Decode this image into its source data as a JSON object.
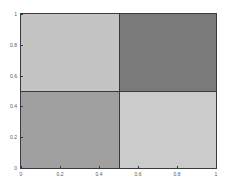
{
  "chart_data": {
    "type": "heatmap",
    "title": "",
    "xlabel": "",
    "ylabel": "",
    "xlim": [
      0,
      1
    ],
    "ylim": [
      0,
      1
    ],
    "grid": false,
    "legend": null,
    "x_ticks": [
      "0",
      "0.2",
      "0.4",
      "0.6",
      "0.8",
      "1"
    ],
    "y_ticks": [
      "0",
      "0.2",
      "0.4",
      "0.6",
      "0.8",
      "1"
    ],
    "x_edges": [
      0,
      0.5,
      1
    ],
    "y_edges": [
      0,
      0.5,
      1
    ],
    "cells": [
      {
        "x0": 0,
        "x1": 0.5,
        "y0": 0.5,
        "y1": 1,
        "color": "#c4c4c4",
        "shade": "light"
      },
      {
        "x0": 0.5,
        "x1": 1,
        "y0": 0.5,
        "y1": 1,
        "color": "#7a7a7a",
        "shade": "dark"
      },
      {
        "x0": 0,
        "x1": 0.5,
        "y0": 0,
        "y1": 0.5,
        "color": "#a0a0a0",
        "shade": "medium"
      },
      {
        "x0": 0.5,
        "x1": 1,
        "y0": 0,
        "y1": 0.5,
        "color": "#cbcbcb",
        "shade": "light"
      }
    ]
  }
}
